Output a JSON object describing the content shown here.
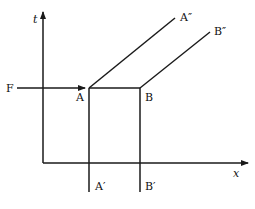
{
  "diagram": {
    "axes": {
      "y_label": "t",
      "x_label": "x"
    },
    "labels": {
      "F": "F",
      "A": "A",
      "B": "B",
      "A_double_prime": "A″",
      "B_double_prime": "B″",
      "A_prime": "A′",
      "B_prime": "B′"
    },
    "colors": {
      "line": "#1a1a1a",
      "background": "#ffffff"
    }
  }
}
